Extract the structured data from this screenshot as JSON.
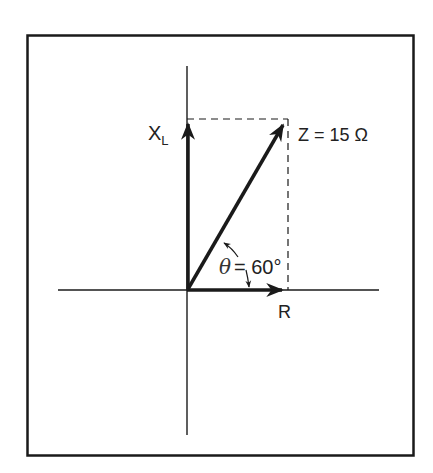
{
  "figure": {
    "type": "impedance phasor diagram",
    "colors": {
      "ink": "#1a1a1a",
      "background": "#ffffff"
    }
  },
  "labels": {
    "xl_main": "X",
    "xl_sub": "L",
    "z": "Z = 15 Ω",
    "theta_symbol": "θ",
    "theta_value": "= 60°",
    "r": "R"
  },
  "phasors": [
    {
      "name": "X_L",
      "direction": "vertical (up)",
      "label": "X_L"
    },
    {
      "name": "R",
      "direction": "horizontal (right)",
      "label": "R"
    },
    {
      "name": "Z",
      "direction": "60° from R",
      "magnitude": "15 Ω",
      "label": "Z = 15 Ω"
    }
  ],
  "angle": {
    "symbol": "θ",
    "value": "60°"
  }
}
